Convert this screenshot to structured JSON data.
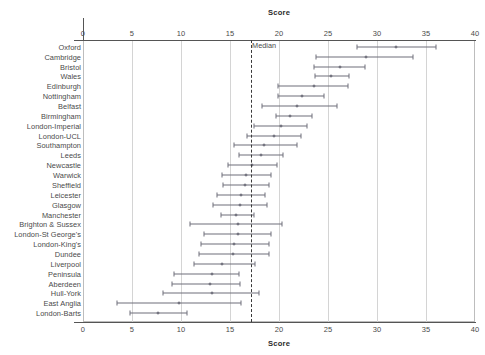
{
  "chart_data": {
    "type": "scatter",
    "title": "",
    "xlabel": "Score",
    "ylabel": "",
    "xlim": [
      0,
      40
    ],
    "xticks": [
      0,
      5,
      10,
      15,
      20,
      25,
      30,
      35,
      40
    ],
    "xticklabels": [
      "0",
      "5",
      "10",
      "15",
      "20",
      "25",
      "30",
      "35",
      "40"
    ],
    "top_axis_title": "Score",
    "bottom_axis_title": "Score",
    "grid": "vertical",
    "legend": "none",
    "annotations": [
      {
        "label": "Median",
        "x": 17.1,
        "type": "vline-dashed"
      }
    ],
    "median_line": 17.1,
    "series_name": "Score with 95% CI",
    "point_marker": "circle",
    "categories": [
      "Oxford",
      "Cambridge",
      "Bristol",
      "Wales",
      "Edinburgh",
      "Nottingham",
      "Belfast",
      "Birmingham",
      "London-Imperial",
      "London-UCL",
      "Southampton",
      "Leeds",
      "Newcastle",
      "Warwick",
      "Sheffield",
      "Leicester",
      "Glasgow",
      "Manchester",
      "Brighton & Sussex",
      "London-St George's",
      "London-King's",
      "Dundee",
      "Liverpool",
      "Peninsula",
      "Aberdeen",
      "Hull-York",
      "East Anglia",
      "London-Barts"
    ],
    "values": [
      31.9,
      28.9,
      26.2,
      25.3,
      23.6,
      22.3,
      21.8,
      21.1,
      20.2,
      19.5,
      18.5,
      18.2,
      17.2,
      16.6,
      16.5,
      16.1,
      16.0,
      15.6,
      15.8,
      15.8,
      15.4,
      15.3,
      14.2,
      13.2,
      13.0,
      13.2,
      9.8,
      7.7
    ],
    "ci_low": [
      28.0,
      23.8,
      23.6,
      23.7,
      19.9,
      19.9,
      18.3,
      19.7,
      17.4,
      16.7,
      15.4,
      15.9,
      14.8,
      14.2,
      14.3,
      13.7,
      13.3,
      14.1,
      10.9,
      12.3,
      12.0,
      11.8,
      11.3,
      9.3,
      9.1,
      8.2,
      3.5,
      4.8
    ],
    "ci_high": [
      36.0,
      33.7,
      28.8,
      27.1,
      27.0,
      24.6,
      25.9,
      23.4,
      22.9,
      22.2,
      21.8,
      20.4,
      19.8,
      19.2,
      19.0,
      18.6,
      18.8,
      17.4,
      20.3,
      19.2,
      19.0,
      19.0,
      17.6,
      15.9,
      16.0,
      18.0,
      16.1,
      10.6
    ]
  },
  "colors": {
    "point_fill": "#8a8a96",
    "line": "#6e6e7a",
    "grid": "#d4d4d4",
    "axis": "#555555",
    "text": "#4a4a4a",
    "median_dash": "#3a3a3a",
    "background": "#ffffff"
  }
}
